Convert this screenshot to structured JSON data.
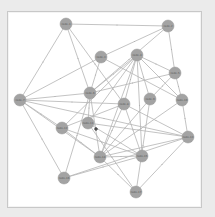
{
  "diagram": {
    "type": "network-graph",
    "background_color": "#ebebeb",
    "canvas_color": "#ffffff",
    "node_color": "#a3a3a3",
    "edge_color": "#b4b4b4",
    "node_radius": 6,
    "nodes": [
      {
        "id": "n1",
        "label": "node-1",
        "x": 66,
        "y": 24
      },
      {
        "id": "n2",
        "label": "node-2",
        "x": 168,
        "y": 26
      },
      {
        "id": "n3",
        "label": "node-3",
        "x": 101,
        "y": 57
      },
      {
        "id": "n4",
        "label": "node-4",
        "x": 137,
        "y": 55
      },
      {
        "id": "n5",
        "label": "node-5",
        "x": 175,
        "y": 73
      },
      {
        "id": "n6",
        "label": "node-6",
        "x": 90,
        "y": 93
      },
      {
        "id": "n7",
        "label": "node-7",
        "x": 20,
        "y": 100
      },
      {
        "id": "n8",
        "label": "node-8",
        "x": 124,
        "y": 104
      },
      {
        "id": "n9",
        "label": "node-9",
        "x": 150,
        "y": 99
      },
      {
        "id": "n10",
        "label": "node-10",
        "x": 182,
        "y": 100
      },
      {
        "id": "n11",
        "label": "node-11",
        "x": 88,
        "y": 123
      },
      {
        "id": "n12",
        "label": "node-12",
        "x": 62,
        "y": 128
      },
      {
        "id": "n13",
        "label": "node-13",
        "x": 188,
        "y": 137
      },
      {
        "id": "n14",
        "label": "node-14",
        "x": 100,
        "y": 157
      },
      {
        "id": "n15",
        "label": "node-15",
        "x": 142,
        "y": 156
      },
      {
        "id": "n16",
        "label": "node-16",
        "x": 64,
        "y": 178
      },
      {
        "id": "n17",
        "label": "node-17",
        "x": 136,
        "y": 192
      }
    ],
    "edges": [
      [
        "n1",
        "n2"
      ],
      [
        "n1",
        "n7"
      ],
      [
        "n1",
        "n6"
      ],
      [
        "n1",
        "n8"
      ],
      [
        "n2",
        "n3"
      ],
      [
        "n2",
        "n5"
      ],
      [
        "n2",
        "n6"
      ],
      [
        "n3",
        "n7"
      ],
      [
        "n3",
        "n10"
      ],
      [
        "n3",
        "n6"
      ],
      [
        "n4",
        "n5"
      ],
      [
        "n4",
        "n6"
      ],
      [
        "n4",
        "n8"
      ],
      [
        "n4",
        "n9"
      ],
      [
        "n4",
        "n10"
      ],
      [
        "n4",
        "n11"
      ],
      [
        "n4",
        "n12"
      ],
      [
        "n4",
        "n14"
      ],
      [
        "n4",
        "n15"
      ],
      [
        "n5",
        "n6"
      ],
      [
        "n5",
        "n9"
      ],
      [
        "n5",
        "n10"
      ],
      [
        "n6",
        "n7"
      ],
      [
        "n6",
        "n11"
      ],
      [
        "n6",
        "n14"
      ],
      [
        "n6",
        "n16"
      ],
      [
        "n7",
        "n8"
      ],
      [
        "n7",
        "n12"
      ],
      [
        "n7",
        "n14"
      ],
      [
        "n7",
        "n16"
      ],
      [
        "n7",
        "n13"
      ],
      [
        "n8",
        "n13"
      ],
      [
        "n8",
        "n14"
      ],
      [
        "n8",
        "n15"
      ],
      [
        "n8",
        "n12"
      ],
      [
        "n9",
        "n14"
      ],
      [
        "n9",
        "n17"
      ],
      [
        "n10",
        "n13"
      ],
      [
        "n10",
        "n14"
      ],
      [
        "n11",
        "n13"
      ],
      [
        "n11",
        "n17"
      ],
      [
        "n11",
        "n15"
      ],
      [
        "n12",
        "n14"
      ],
      [
        "n12",
        "n15"
      ],
      [
        "n13",
        "n14"
      ],
      [
        "n13",
        "n17"
      ],
      [
        "n14",
        "n15"
      ],
      [
        "n14",
        "n17"
      ],
      [
        "n15",
        "n16"
      ],
      [
        "n16",
        "n13"
      ]
    ],
    "cursor": {
      "x": 96,
      "y": 129
    }
  }
}
